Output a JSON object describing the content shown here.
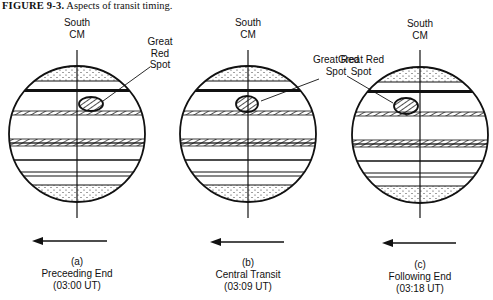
{
  "figure": {
    "number": "FIGURE 9-3.",
    "title": "Aspects of transit timing."
  },
  "panels": [
    {
      "id": "a",
      "cm_label_line1": "South",
      "cm_label_line2": "CM",
      "grs_label": [
        "Great",
        "Red",
        "Spot"
      ],
      "letter": "(a)",
      "name": "Preceeding End",
      "time": "(03:00 UT)",
      "center_x": 77
    },
    {
      "id": "b",
      "cm_label_line1": "South",
      "cm_label_line2": "CM",
      "grs_label": [
        "Great Red",
        "Spot"
      ],
      "letter": "(b)",
      "name": "Central Transit",
      "time": "(03:09 UT)",
      "center_x": 248
    },
    {
      "id": "c",
      "cm_label_line1": "South",
      "cm_label_line2": "CM",
      "grs_label": [
        "Great Red",
        "Spot"
      ],
      "letter": "(c)",
      "name": "Following End",
      "time": "(03:18 UT)",
      "center_x": 420
    }
  ],
  "rotation_arrow_direction": "left",
  "colors": {
    "ink": "#111111",
    "paper": "#ffffff"
  }
}
